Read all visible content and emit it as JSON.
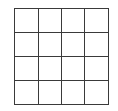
{
  "grid": {
    "rows": 4,
    "cols": 4,
    "line_color": "#3a3a3a",
    "cells": [
      [
        "",
        "",
        "",
        ""
      ],
      [
        "",
        "",
        "",
        ""
      ],
      [
        "",
        "",
        "",
        ""
      ],
      [
        "",
        "",
        "",
        ""
      ]
    ]
  }
}
